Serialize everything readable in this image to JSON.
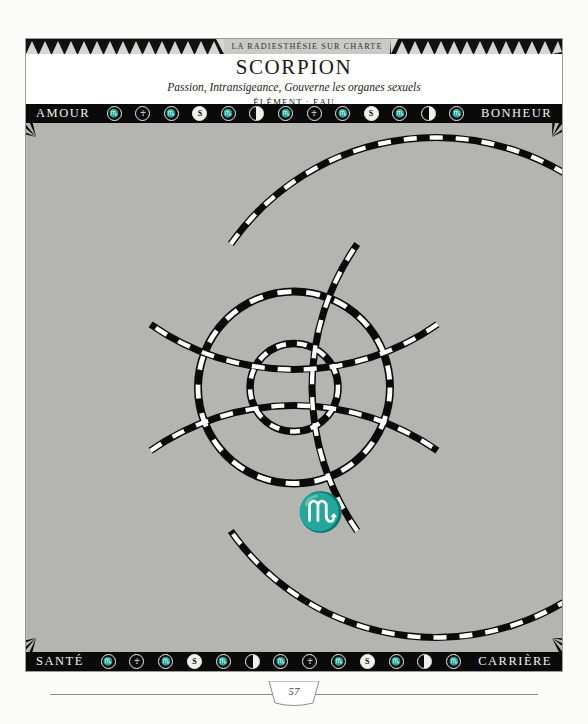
{
  "header": {
    "band_title": "LA RADIESTHÉSIE SUR CHARTE",
    "sign": "SCORPION",
    "subtitle": "Passion, Intransigeance, Gouverne les organes sexuels",
    "element": "ÉLÉMENT : EAU"
  },
  "bars": {
    "top_left_label": "AMOUR",
    "top_right_label": "BONHEUR",
    "bottom_left_label": "SANTÉ",
    "bottom_right_label": "CARRIÈRE",
    "symbol_sequence": [
      "scorpio-glyph-icon",
      "globe-icon",
      "scorpio-glyph-icon",
      "dollar-icon",
      "scorpio-glyph-icon",
      "moon-icon",
      "scorpio-glyph-icon",
      "globe-icon",
      "scorpio-glyph-icon",
      "dollar-icon",
      "scorpio-glyph-icon",
      "moon-icon",
      "scorpio-glyph-icon"
    ],
    "symbol_glyphs": {
      "scorpio-glyph-icon": "♏",
      "globe-icon": "☥",
      "dollar-icon": "S",
      "moon-icon": ""
    }
  },
  "center": {
    "zodiac_glyph": "♏",
    "glyph_name": "scorpio-glyph-icon"
  },
  "quadrants": {
    "amour": {
      "title": "AMOUR",
      "rays": [
        {
          "text": "Vivacité",
          "tone": "gray"
        },
        {
          "text": "Tout ou rien",
          "tone": "black"
        },
        {
          "text": "Diversité/variation",
          "tone": "gray"
        },
        {
          "text": "Provocation/étrangeté",
          "tone": "black"
        },
        {
          "text": "Puissance",
          "tone": "gray"
        },
        {
          "text": "Allez à la charte zodiacale",
          "tone": "black"
        }
      ]
    },
    "bonheur": {
      "title": "BONHEUR",
      "rays": [
        {
          "text": "Exercice des pouvoirs mentaux",
          "tone": "black"
        },
        {
          "text": "Plaisanteries",
          "tone": "gray"
        },
        {
          "text": "Entêtement",
          "tone": "black"
        },
        {
          "text": "Solitude (pour un temps)",
          "tone": "gray"
        },
        {
          "text": "Obscurcissement",
          "tone": "black"
        },
        {
          "text": "Allez à la charte zodiacale",
          "tone": "gray"
        }
      ]
    },
    "sante": {
      "title": "SANTÉ",
      "rays": [
        {
          "text": "Excès dans les deux sens",
          "tone": "gray"
        },
        {
          "text": "Mystère...",
          "tone": "black"
        },
        {
          "text": "Prostate",
          "tone": "gray"
        },
        {
          "text": "Problèmes ovariens",
          "tone": "black"
        },
        {
          "text": "Problèmes vasculaires",
          "tone": "gray"
        },
        {
          "text": "Allez à la charte zodiacale",
          "tone": "black"
        }
      ]
    },
    "carriere": {
      "title": "CARRIÈRE",
      "rays": [
        {
          "text": "Psychiatre",
          "tone": "black"
        },
        {
          "text": "Détective/espion",
          "tone": "gray"
        },
        {
          "text": "Employé des pompes funèbres",
          "tone": "black"
        },
        {
          "text": "Médium",
          "tone": "gray"
        },
        {
          "text": "Homme d'affaires",
          "tone": "black"
        },
        {
          "text": "Allez à la charte zodiacale",
          "tone": "gray"
        }
      ]
    }
  },
  "footer": {
    "page_number": "57"
  },
  "colors": {
    "ink": "#0a0a0a",
    "paper": "#ffffff",
    "wheel_gray": "#b4b4b0",
    "band_gray": "#c9c9c5",
    "text_light": "#f2f2ee"
  }
}
